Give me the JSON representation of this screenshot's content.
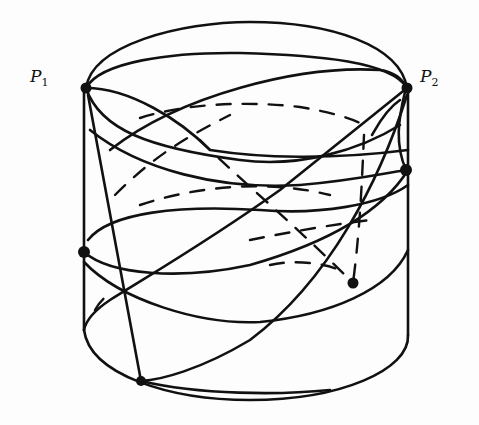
{
  "diagram": {
    "stroke_color": "#111111",
    "background": "#fdfdfd",
    "labels": {
      "p1": {
        "base": "P",
        "sub": "1"
      },
      "p2": {
        "base": "P",
        "sub": "2"
      }
    },
    "points": [
      {
        "id": "P1",
        "x": 86,
        "y": 88,
        "label": "P1"
      },
      {
        "id": "P2",
        "x": 407,
        "y": 88,
        "label": "P2"
      },
      {
        "id": "left-mid",
        "x": 84,
        "y": 252
      },
      {
        "id": "right-mid",
        "x": 406,
        "y": 170
      },
      {
        "id": "back-point",
        "x": 353,
        "y": 283
      },
      {
        "id": "bottom-point",
        "x": 141,
        "y": 381
      }
    ],
    "cylinder": {
      "top_ellipse": {
        "cx": 246,
        "cy": 88,
        "rx": 161,
        "ry": 68
      },
      "bottom_ellipse_front": {
        "cx": 246,
        "cy": 336,
        "rx": 161,
        "ry": 66
      },
      "left_x": 84,
      "right_x": 408,
      "top_y": 88,
      "bottom_y": 336
    }
  }
}
